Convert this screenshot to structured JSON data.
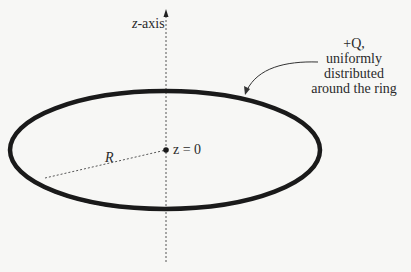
{
  "diagram": {
    "axis": {
      "label_var": "z",
      "label_rest": "-axis"
    },
    "charge": {
      "line1": "+Q,",
      "line2": "uniformly distributed",
      "line3": "around the ring"
    },
    "origin": {
      "label": "z = 0"
    },
    "radius": {
      "label": "R"
    }
  },
  "colors": {
    "background": "#f7f7f5",
    "ring": "#1a1a1a",
    "text": "#2a2a2a"
  }
}
